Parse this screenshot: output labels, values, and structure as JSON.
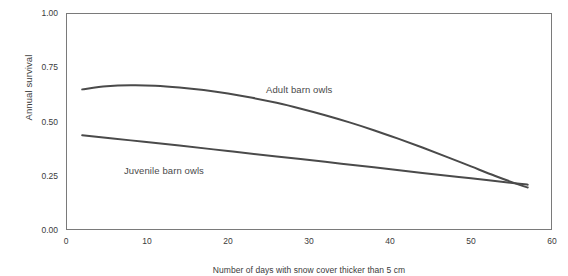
{
  "chart_data": {
    "type": "line",
    "title": "",
    "xlabel": "Number of days with snow cover thicker than 5 cm",
    "ylabel": "Annual survival",
    "xlim": [
      0,
      60
    ],
    "ylim": [
      0.0,
      1.0
    ],
    "xticks": [
      "0",
      "10",
      "20",
      "30",
      "40",
      "50",
      "60"
    ],
    "xtick_values": [
      0,
      10,
      20,
      30,
      40,
      50,
      60
    ],
    "yticks": [
      "0.00",
      "0.25",
      "0.50",
      "0.75",
      "1.00"
    ],
    "ytick_values": [
      0.0,
      0.25,
      0.5,
      0.75,
      1.0
    ],
    "grid": false,
    "legend_position": "inline-annotations",
    "line_color": "#4a4a4a",
    "frame_color": "#7a7a7a",
    "background_color": "#ffffff",
    "series": [
      {
        "name": "Adult barn owls",
        "label_text": "Adult barn owls",
        "x": [
          2,
          5,
          8,
          11,
          14,
          17,
          20,
          23,
          26,
          29,
          32,
          35,
          38,
          41,
          44,
          47,
          50,
          53,
          56,
          57
        ],
        "values": [
          0.648,
          0.662,
          0.667,
          0.665,
          0.657,
          0.645,
          0.629,
          0.609,
          0.586,
          0.559,
          0.529,
          0.496,
          0.46,
          0.421,
          0.38,
          0.337,
          0.293,
          0.249,
          0.208,
          0.196
        ]
      },
      {
        "name": "Juvenile barn owls",
        "label_text": "Juvenile barn owls",
        "x": [
          2,
          8,
          14,
          20,
          26,
          32,
          38,
          44,
          50,
          56,
          57
        ],
        "values": [
          0.437,
          0.413,
          0.389,
          0.364,
          0.339,
          0.314,
          0.289,
          0.263,
          0.238,
          0.213,
          0.209
        ]
      }
    ]
  },
  "axes": {
    "y_title": "Annual survival",
    "x_title": "Number of days with snow cover thicker than 5 cm"
  },
  "annotations": {
    "adult": "Adult barn owls",
    "juvenile": "Juvenile barn owls"
  }
}
